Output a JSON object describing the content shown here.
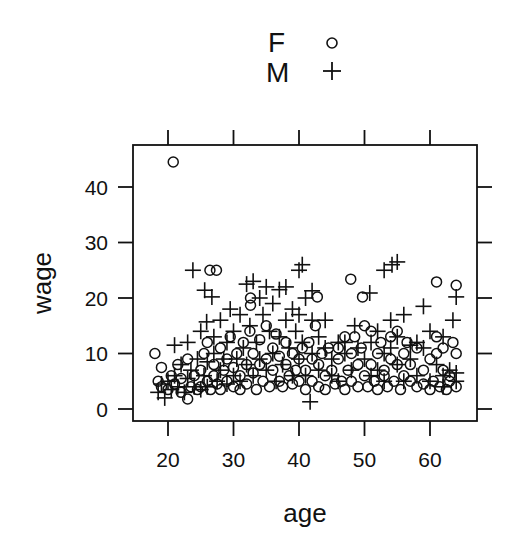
{
  "chart_data": {
    "type": "scatter",
    "title": "",
    "xlabel": "age",
    "ylabel": "wage",
    "xlim": [
      16.5,
      67
    ],
    "ylim": [
      -2,
      47
    ],
    "xticks": [
      20,
      30,
      40,
      50,
      60
    ],
    "yticks": [
      0,
      10,
      20,
      30,
      40
    ],
    "grid": false,
    "legend": {
      "position": "top",
      "entries": [
        {
          "label": "F",
          "symbol": "circle"
        },
        {
          "label": "M",
          "symbol": "plus"
        }
      ]
    },
    "series": [
      {
        "name": "F",
        "symbol": "circle",
        "points": [
          [
            20.8,
            44.5
          ],
          [
            26.4,
            25
          ],
          [
            27.4,
            25
          ],
          [
            32.6,
            20
          ],
          [
            32.6,
            18.7
          ],
          [
            42.8,
            20.2
          ],
          [
            47.9,
            23.4
          ],
          [
            49.7,
            20.2
          ],
          [
            61,
            22.9
          ],
          [
            64,
            22.3
          ],
          [
            18,
            10
          ],
          [
            18.5,
            5
          ],
          [
            19,
            4
          ],
          [
            19,
            7.5
          ],
          [
            20,
            3.5
          ],
          [
            20.5,
            6
          ],
          [
            21,
            4.5
          ],
          [
            21.5,
            8
          ],
          [
            22,
            3
          ],
          [
            22,
            5.5
          ],
          [
            23,
            1.8
          ],
          [
            23,
            9
          ],
          [
            23.5,
            4
          ],
          [
            24,
            6
          ],
          [
            24.5,
            3.5
          ],
          [
            25,
            7
          ],
          [
            25,
            4
          ],
          [
            25.5,
            10
          ],
          [
            26,
            5
          ],
          [
            26,
            12
          ],
          [
            26.5,
            3.5
          ],
          [
            27,
            8
          ],
          [
            27,
            6
          ],
          [
            27.5,
            4.5
          ],
          [
            28,
            11
          ],
          [
            28,
            3.5
          ],
          [
            28.5,
            7
          ],
          [
            29,
            9
          ],
          [
            29,
            5
          ],
          [
            29.5,
            13
          ],
          [
            30,
            4
          ],
          [
            30,
            7.5
          ],
          [
            30.5,
            10
          ],
          [
            31,
            6
          ],
          [
            31,
            3.5
          ],
          [
            31.5,
            12
          ],
          [
            32,
            8
          ],
          [
            32,
            4.5
          ],
          [
            32.5,
            14
          ],
          [
            33,
            6.5
          ],
          [
            33,
            10
          ],
          [
            33.5,
            3.5
          ],
          [
            34,
            8
          ],
          [
            34,
            12.5
          ],
          [
            34.5,
            5
          ],
          [
            35,
            15
          ],
          [
            35,
            9
          ],
          [
            35.5,
            4
          ],
          [
            36,
            7
          ],
          [
            36,
            11
          ],
          [
            36.5,
            13.5
          ],
          [
            37,
            5
          ],
          [
            37,
            9.5
          ],
          [
            37.5,
            4
          ],
          [
            38,
            8
          ],
          [
            38,
            12
          ],
          [
            38.5,
            6
          ],
          [
            39,
            10
          ],
          [
            39,
            4.5
          ],
          [
            39.5,
            7
          ],
          [
            40,
            5
          ],
          [
            40,
            9
          ],
          [
            40.5,
            11
          ],
          [
            41,
            7
          ],
          [
            41,
            3.5
          ],
          [
            41.5,
            12
          ],
          [
            42,
            5
          ],
          [
            42,
            9
          ],
          [
            42.5,
            15
          ],
          [
            43,
            4
          ],
          [
            43,
            8
          ],
          [
            43.5,
            10
          ],
          [
            44,
            6
          ],
          [
            44,
            3.5
          ],
          [
            44.5,
            11
          ],
          [
            45,
            7
          ],
          [
            45.5,
            4.5
          ],
          [
            46,
            9
          ],
          [
            46,
            11
          ],
          [
            46.5,
            5
          ],
          [
            47,
            13
          ],
          [
            47,
            3.5
          ],
          [
            47.5,
            7
          ],
          [
            48,
            10
          ],
          [
            48,
            5
          ],
          [
            48.5,
            13
          ],
          [
            49,
            8
          ],
          [
            49,
            4
          ],
          [
            49.5,
            11
          ],
          [
            50,
            6
          ],
          [
            50,
            15
          ],
          [
            50.5,
            4
          ],
          [
            51,
            8
          ],
          [
            51,
            14
          ],
          [
            51.5,
            5
          ],
          [
            52,
            10
          ],
          [
            52,
            3.5
          ],
          [
            52.5,
            12
          ],
          [
            53,
            6
          ],
          [
            53,
            7
          ],
          [
            53.5,
            4
          ],
          [
            54,
            9
          ],
          [
            54,
            13
          ],
          [
            54.5,
            5
          ],
          [
            55,
            8
          ],
          [
            55,
            14
          ],
          [
            55.5,
            3.5
          ],
          [
            56,
            10
          ],
          [
            56,
            6
          ],
          [
            56.5,
            12
          ],
          [
            57,
            5
          ],
          [
            57,
            8
          ],
          [
            58,
            11
          ],
          [
            58,
            4
          ],
          [
            59,
            7
          ],
          [
            59,
            4.5
          ],
          [
            60,
            3.5
          ],
          [
            60,
            9
          ],
          [
            60.5,
            5
          ],
          [
            61,
            13
          ],
          [
            61,
            10
          ],
          [
            61.5,
            4
          ],
          [
            62,
            7
          ],
          [
            62,
            11
          ],
          [
            62.5,
            3.5
          ],
          [
            63,
            5
          ],
          [
            63,
            6
          ],
          [
            63.5,
            12
          ],
          [
            64,
            4
          ],
          [
            64,
            10
          ]
        ]
      },
      {
        "name": "M",
        "symbol": "plus",
        "points": [
          [
            23.8,
            25
          ],
          [
            25.6,
            21.4
          ],
          [
            26.7,
            20.2
          ],
          [
            25.9,
            15.7
          ],
          [
            40.5,
            26
          ],
          [
            40,
            25
          ],
          [
            42,
            21.3
          ],
          [
            41.7,
            1.3
          ],
          [
            50.8,
            20.9
          ],
          [
            53,
            25
          ],
          [
            54.2,
            26
          ],
          [
            55,
            26.5
          ],
          [
            48.5,
            15
          ],
          [
            56,
            17
          ],
          [
            59,
            18.5
          ],
          [
            62,
            13
          ],
          [
            63.5,
            16
          ],
          [
            64,
            20.2
          ],
          [
            47,
            12
          ],
          [
            57,
            11.5
          ],
          [
            18.5,
            3
          ],
          [
            19,
            4.5
          ],
          [
            19.5,
            2
          ],
          [
            20,
            5
          ],
          [
            20.5,
            3.5
          ],
          [
            21,
            6
          ],
          [
            21,
            11.5
          ],
          [
            21.5,
            4
          ],
          [
            22,
            8
          ],
          [
            22.5,
            3
          ],
          [
            23,
            5.5
          ],
          [
            23,
            12
          ],
          [
            23.5,
            7
          ],
          [
            24,
            4
          ],
          [
            24.5,
            9
          ],
          [
            25,
            3.5
          ],
          [
            25,
            14
          ],
          [
            25.5,
            6
          ],
          [
            26,
            8.5
          ],
          [
            26,
            4
          ],
          [
            27,
            10
          ],
          [
            27,
            13
          ],
          [
            27.5,
            5
          ],
          [
            28,
            16
          ],
          [
            28,
            7
          ],
          [
            28.5,
            9
          ],
          [
            29,
            4.5
          ],
          [
            29,
            12
          ],
          [
            29.5,
            18
          ],
          [
            30,
            6
          ],
          [
            30,
            14
          ],
          [
            30.5,
            9
          ],
          [
            31,
            17
          ],
          [
            31,
            5
          ],
          [
            31.5,
            11
          ],
          [
            32,
            22.5
          ],
          [
            32,
            8
          ],
          [
            32.5,
            15
          ],
          [
            33,
            23
          ],
          [
            33,
            6
          ],
          [
            33.5,
            12
          ],
          [
            34,
            9
          ],
          [
            34,
            20
          ],
          [
            34.5,
            17
          ],
          [
            35,
            22
          ],
          [
            35,
            7
          ],
          [
            35.5,
            14
          ],
          [
            36,
            10
          ],
          [
            36,
            19
          ],
          [
            36.5,
            5
          ],
          [
            37,
            13
          ],
          [
            37,
            21.5
          ],
          [
            37.5,
            8
          ],
          [
            38,
            16
          ],
          [
            38,
            22
          ],
          [
            38.5,
            11
          ],
          [
            39,
            18
          ],
          [
            39,
            6
          ],
          [
            39.5,
            14
          ],
          [
            40,
            9
          ],
          [
            40,
            17
          ],
          [
            40.5,
            12
          ],
          [
            41,
            20
          ],
          [
            41,
            6
          ],
          [
            42,
            16
          ],
          [
            42,
            10
          ],
          [
            43,
            13
          ],
          [
            43,
            7
          ],
          [
            44,
            11
          ],
          [
            44,
            16
          ],
          [
            45,
            9
          ],
          [
            45,
            6
          ],
          [
            46,
            12
          ],
          [
            46,
            5
          ],
          [
            47,
            10
          ],
          [
            48,
            7
          ],
          [
            49,
            11
          ],
          [
            50,
            9
          ],
          [
            51,
            12
          ],
          [
            51,
            6
          ],
          [
            52,
            14
          ],
          [
            52,
            7
          ],
          [
            53,
            10
          ],
          [
            53,
            5
          ],
          [
            54,
            11
          ],
          [
            54,
            16
          ],
          [
            55,
            8
          ],
          [
            55,
            13
          ],
          [
            56,
            5
          ],
          [
            57,
            9
          ],
          [
            58,
            12
          ],
          [
            58,
            6
          ],
          [
            59,
            11
          ],
          [
            60,
            5
          ],
          [
            60,
            14
          ],
          [
            61,
            8
          ],
          [
            62,
            4
          ],
          [
            62,
            6
          ],
          [
            63,
            7
          ],
          [
            64,
            6.5
          ],
          [
            64,
            5
          ]
        ]
      }
    ]
  },
  "legend": {
    "f_label": "F",
    "m_label": "M"
  },
  "axes": {
    "xlabel": "age",
    "ylabel": "wage",
    "xtick_labels": [
      "20",
      "30",
      "40",
      "50",
      "60"
    ],
    "ytick_labels": [
      "0",
      "10",
      "20",
      "30",
      "40"
    ]
  }
}
